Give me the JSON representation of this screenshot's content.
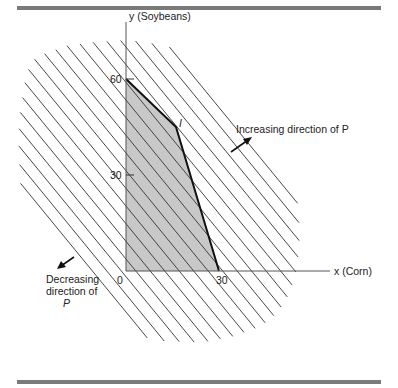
{
  "figure": {
    "y_axis_label": "y (Soybeans)",
    "x_axis_label": "x (Corn)",
    "origin_label": "0",
    "x_tick_label": "30",
    "y_tick_labels": [
      "60",
      "30"
    ],
    "vertex_label": "I",
    "increasing_label": "Increasing direction of P",
    "decreasing_label_lines": [
      "Decreasing",
      "direction of",
      "P"
    ],
    "colors": {
      "region_fill": "#c8c8c8",
      "line": "#222222",
      "rule_bar": "#7a7a7a"
    }
  },
  "chart_data": {
    "type": "diagram",
    "title": "",
    "xlabel": "x (Corn)",
    "ylabel": "y (Soybeans)",
    "feasible_region_vertices": [
      [
        0,
        0
      ],
      [
        0,
        60
      ],
      [
        15,
        48
      ],
      [
        30,
        0
      ]
    ],
    "vertex_I": [
      15,
      48
    ],
    "x_ticks": [
      0,
      30
    ],
    "y_ticks": [
      30,
      60
    ],
    "iso_profit_lines": "family of parallel lines with negative slope (P = constant)",
    "annotations": [
      "Increasing direction of P",
      "Decreasing direction of P"
    ]
  }
}
